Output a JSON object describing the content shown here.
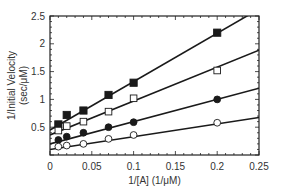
{
  "chart_data": {
    "type": "scatter",
    "title": "",
    "xlabel": "1/[A] (1/μM)",
    "ylabel_line1": "1/Initial Velocity",
    "ylabel_line2": "(sec/μM)",
    "xlim": [
      0,
      0.25
    ],
    "ylim": [
      0,
      2.5
    ],
    "xticks": [
      0,
      0.05,
      0.1,
      0.15,
      0.2,
      0.25
    ],
    "xtick_labels": [
      "0",
      "0.05",
      "0.1",
      "0.15",
      "0.2",
      "0.25"
    ],
    "yticks": [
      0.5,
      1,
      1.5,
      2,
      2.5
    ],
    "ytick_labels": [
      "0.5",
      "1",
      "1.5",
      "2",
      "2.5"
    ],
    "grid": false,
    "legend": "none",
    "series": [
      {
        "name": "filled-square",
        "marker": "square",
        "filled": true,
        "x": [
          0.01,
          0.02,
          0.04,
          0.07,
          0.1,
          0.2
        ],
        "y": [
          0.55,
          0.72,
          0.8,
          1.08,
          1.3,
          2.2
        ],
        "fit": {
          "intercept": 0.45,
          "slope": 8.7
        }
      },
      {
        "name": "open-square",
        "marker": "square",
        "filled": false,
        "x": [
          0.01,
          0.02,
          0.04,
          0.07,
          0.1,
          0.2
        ],
        "y": [
          0.44,
          0.52,
          0.6,
          0.78,
          1.02,
          1.52
        ],
        "fit": {
          "intercept": 0.36,
          "slope": 6.1
        }
      },
      {
        "name": "filled-circle",
        "marker": "circle",
        "filled": true,
        "x": [
          0.01,
          0.02,
          0.04,
          0.07,
          0.1,
          0.2
        ],
        "y": [
          0.27,
          0.33,
          0.4,
          0.5,
          0.59,
          1.0
        ],
        "fit": {
          "intercept": 0.2,
          "slope": 4.0
        }
      },
      {
        "name": "open-circle",
        "marker": "circle",
        "filled": false,
        "x": [
          0.01,
          0.02,
          0.04,
          0.07,
          0.1,
          0.2
        ],
        "y": [
          0.15,
          0.17,
          0.2,
          0.29,
          0.36,
          0.58
        ],
        "fit": {
          "intercept": 0.1,
          "slope": 2.3
        }
      }
    ]
  }
}
